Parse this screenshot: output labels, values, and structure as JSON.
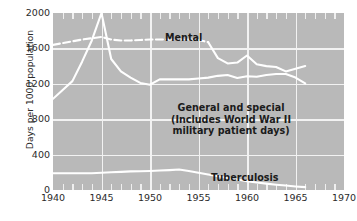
{
  "chart_data": {
    "type": "line",
    "title": "",
    "xlabel": "",
    "ylabel": "Days per 1000 population",
    "xlim": [
      1940,
      1970
    ],
    "ylim": [
      0,
      2000
    ],
    "grid": true,
    "legend_position": "inline-annotations",
    "background_color": "#b9b9b9",
    "line_color": "#ffffff",
    "x_ticks": [
      "1940",
      "1945",
      "1950",
      "1955",
      "1960",
      "1965",
      "1970"
    ],
    "y_ticks": [
      "0",
      "400",
      "800",
      "1200",
      "1600",
      "2000"
    ],
    "annotations": {
      "mental": "Mental",
      "tuberculosis": "Tuberculosis",
      "general_line1": "General and special",
      "general_line2": "(Includes World War II",
      "general_line3": "military patient days)"
    },
    "series": [
      {
        "name": "Mental",
        "style": "dashed-then-solid",
        "dash_until_x": 1956,
        "x": [
          1940,
          1941,
          1942,
          1943,
          1944,
          1945,
          1946,
          1947,
          1948,
          1949,
          1950,
          1951,
          1952,
          1953,
          1954,
          1955,
          1956,
          1957,
          1958,
          1959,
          1960,
          1961,
          1962,
          1963,
          1964,
          1965,
          1966
        ],
        "values": [
          1640,
          1660,
          1680,
          1700,
          1715,
          1730,
          1700,
          1690,
          1690,
          1695,
          1700,
          1700,
          1700,
          1700,
          1700,
          1695,
          1670,
          1490,
          1430,
          1440,
          1520,
          1420,
          1400,
          1390,
          1340,
          1370,
          1400
        ]
      },
      {
        "name": "General and special",
        "style": "solid",
        "x": [
          1940,
          1941,
          1942,
          1943,
          1944,
          1945,
          1946,
          1947,
          1948,
          1949,
          1950,
          1951,
          1952,
          1953,
          1954,
          1955,
          1956,
          1957,
          1958,
          1959,
          1960,
          1961,
          1962,
          1963,
          1964,
          1965,
          1966
        ],
        "values": [
          1030,
          1130,
          1230,
          1450,
          1690,
          2000,
          1480,
          1340,
          1270,
          1210,
          1190,
          1250,
          1250,
          1250,
          1250,
          1260,
          1270,
          1290,
          1300,
          1265,
          1285,
          1280,
          1300,
          1310,
          1310,
          1270,
          1205
        ]
      },
      {
        "name": "Tuberculosis",
        "style": "solid",
        "x": [
          1940,
          1941,
          1942,
          1943,
          1944,
          1945,
          1946,
          1947,
          1948,
          1949,
          1950,
          1951,
          1952,
          1953,
          1954,
          1955,
          1956,
          1957,
          1958,
          1959,
          1960,
          1961,
          1962,
          1963,
          1964,
          1965,
          1966
        ],
        "values": [
          190,
          190,
          190,
          190,
          190,
          195,
          200,
          205,
          210,
          212,
          215,
          220,
          225,
          232,
          215,
          195,
          175,
          155,
          135,
          118,
          100,
          85,
          72,
          60,
          50,
          40,
          32
        ]
      }
    ]
  }
}
